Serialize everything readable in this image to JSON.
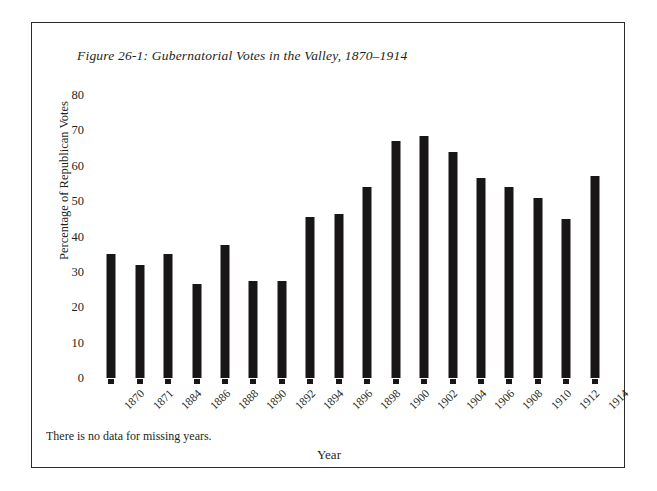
{
  "figure": {
    "title": "Figure 26-1: Gubernatorial Votes in the Valley, 1870–1914",
    "footnote": "There is no data for missing years."
  },
  "chart_data": {
    "type": "bar",
    "title": "Figure 26-1: Gubernatorial Votes in the Valley, 1870–1914",
    "xlabel": "Year",
    "ylabel": "Percentage of Republican Votes",
    "categories": [
      "1870",
      "1871",
      "1884",
      "1886",
      "1888",
      "1890",
      "1892",
      "1894",
      "1896",
      "1898",
      "1900",
      "1902",
      "1904",
      "1906",
      "1908",
      "1910",
      "1912",
      "1914"
    ],
    "values": [
      35,
      32,
      35,
      26.5,
      37.5,
      27.5,
      27.5,
      45.5,
      46.5,
      54,
      67,
      68.5,
      64,
      56.5,
      54,
      51,
      45,
      57
    ],
    "ylim": [
      0,
      80
    ],
    "yticks": [
      "0",
      "10",
      "20",
      "30",
      "40",
      "50",
      "60",
      "70",
      "80"
    ],
    "ytick_values": [
      0,
      10,
      20,
      30,
      40,
      50,
      60,
      70,
      80
    ],
    "grid": false,
    "legend": "none",
    "bar_color": "#191617"
  }
}
